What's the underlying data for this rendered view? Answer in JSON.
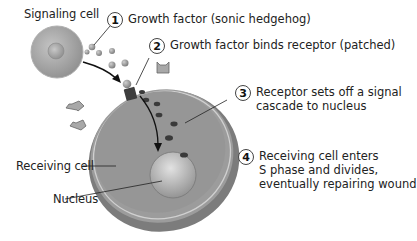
{
  "labels": {
    "signaling_cell": "Signaling cell",
    "receiving_cell": "Receiving cell",
    "nucleus": "Nucleus"
  },
  "steps": [
    {
      "number": "1",
      "text": "Growth factor (sonic hedgehog)"
    },
    {
      "number": "2",
      "text": "Growth factor binds receptor (patched)"
    },
    {
      "number": "3",
      "text": "Receptor sets off a signal\ncascade to nucleus"
    },
    {
      "number": "4",
      "text": "Receiving cell enters\nS phase and divides,\neventually repairing wound"
    }
  ],
  "colors": {
    "cell_fill": "#9a9a9a",
    "cell_rim": "#c8c8c8",
    "nucleus_fill": "#b5b5b5",
    "growth_factor": "#8a8a8a",
    "signal_dot": "#3a3a3a",
    "receptor": "#555555"
  }
}
